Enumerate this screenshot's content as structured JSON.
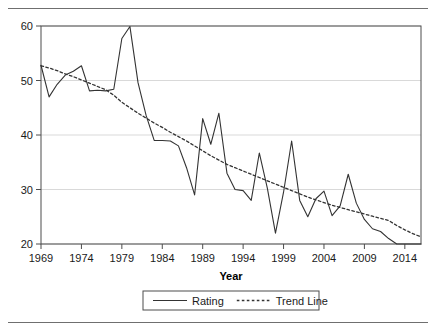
{
  "figure": {
    "background_color": "#ffffff",
    "rule_color": "#6f6f6f",
    "plot_border_color": "#4d4d4d",
    "grid_color": "#d9d9d9"
  },
  "chart_data": {
    "type": "line",
    "title": "",
    "subtitle": "",
    "xlabel": "Year",
    "ylabel": "",
    "xlim": [
      1969,
      2016
    ],
    "ylim": [
      20,
      60
    ],
    "xticks": [
      1969,
      1974,
      1979,
      1984,
      1989,
      1994,
      1999,
      2004,
      2009,
      2014
    ],
    "yticks": [
      20,
      30,
      40,
      50,
      60
    ],
    "xtick_labels": [
      "1969",
      "1974",
      "1979",
      "1984",
      "1989",
      "1994",
      "1999",
      "2004",
      "2009",
      "2014"
    ],
    "ytick_labels": [
      "20",
      "30",
      "40",
      "50",
      "60"
    ],
    "grid": "horizontal",
    "legend_position": "below-axis",
    "x": [
      1969,
      1970,
      1971,
      1972,
      1973,
      1974,
      1975,
      1976,
      1977,
      1978,
      1979,
      1980,
      1981,
      1982,
      1983,
      1984,
      1985,
      1986,
      1987,
      1988,
      1989,
      1990,
      1991,
      1992,
      1993,
      1994,
      1995,
      1996,
      1997,
      1998,
      1999,
      2000,
      2001,
      2002,
      2003,
      2004,
      2005,
      2006,
      2007,
      2008,
      2009,
      2010,
      2011,
      2012,
      2013,
      2014,
      2015,
      2016
    ],
    "series": [
      {
        "name": "Rating",
        "style": "solid",
        "color": "#333333",
        "values": [
          52.8,
          47.0,
          49.3,
          51.0,
          51.7,
          52.7,
          48.1,
          48.2,
          48.1,
          48.4,
          57.7,
          59.9,
          49.6,
          43.6,
          39.0,
          39.0,
          38.9,
          38.0,
          34.0,
          29.0,
          43.0,
          38.3,
          44.0,
          33.0,
          30.0,
          29.8,
          28.0,
          36.7,
          30.2,
          22.0,
          29.5,
          38.9,
          28.0,
          25.0,
          28.3,
          29.7,
          25.2,
          27.0,
          32.8,
          27.5,
          24.5,
          22.8,
          22.3,
          21.0,
          20.0,
          20.0,
          20.0,
          20.0
        ]
      },
      {
        "name": "Trend Line",
        "style": "dotted",
        "color": "#333333",
        "values": [
          52.7,
          52.3,
          51.8,
          51.2,
          50.7,
          50.1,
          49.5,
          48.9,
          48.3,
          47.3,
          46.0,
          45.0,
          44.0,
          43.1,
          42.2,
          41.4,
          40.5,
          39.7,
          38.9,
          38.0,
          37.1,
          36.2,
          35.4,
          34.6,
          34.0,
          33.4,
          32.8,
          32.2,
          31.6,
          31.0,
          30.4,
          29.8,
          29.2,
          28.6,
          28.1,
          27.6,
          27.1,
          26.7,
          26.3,
          25.9,
          25.5,
          25.1,
          24.7,
          24.3,
          23.4,
          22.6,
          21.9,
          21.3
        ]
      }
    ]
  },
  "legend": {
    "entries": [
      {
        "label": "Rating",
        "style": "solid"
      },
      {
        "label": "Trend Line",
        "style": "dotted"
      }
    ]
  }
}
